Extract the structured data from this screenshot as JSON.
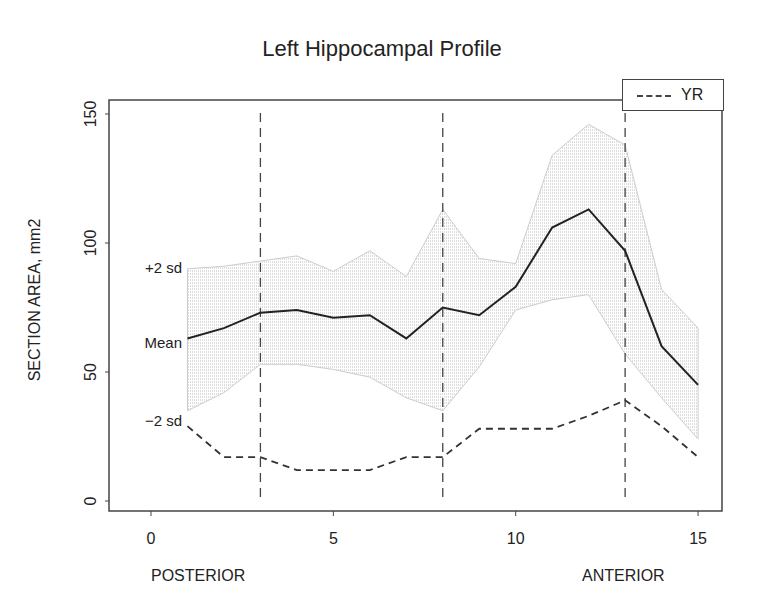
{
  "chart_data": {
    "type": "line",
    "title": "Left Hippocampal Profile",
    "xlabel_left": "POSTERIOR",
    "xlabel_right": "ANTERIOR",
    "ylabel": "SECTION AREA, mm2",
    "xlim": [
      -0.8,
      15.7
    ],
    "ylim": [
      -4,
      155
    ],
    "x_ticks": [
      0,
      5,
      10,
      15
    ],
    "y_ticks": [
      0,
      50,
      100,
      150
    ],
    "grid": false,
    "legend": {
      "position": "top-right",
      "entries": [
        "YR"
      ]
    },
    "vertical_lines": [
      3,
      8,
      13
    ],
    "band_labels": [
      "+2 sd",
      "Mean",
      "-2 sd"
    ],
    "x": [
      1,
      2,
      3,
      4,
      5,
      6,
      7,
      8,
      9,
      10,
      11,
      12,
      13,
      14,
      15
    ],
    "series": [
      {
        "name": "Mean",
        "style": "solid",
        "values": [
          63,
          67,
          73,
          74,
          71,
          72,
          63,
          75,
          72,
          83,
          106,
          113,
          97,
          60,
          45
        ]
      },
      {
        "name": "+2 sd",
        "style": "band-upper",
        "values": [
          90,
          91,
          93,
          95,
          89,
          97,
          87,
          113,
          94,
          92,
          134,
          146,
          138,
          82,
          67
        ]
      },
      {
        "name": "-2 sd",
        "style": "band-lower",
        "values": [
          35,
          42,
          53,
          53,
          51,
          48,
          40,
          35,
          52,
          74,
          78,
          80,
          57,
          40,
          24
        ]
      },
      {
        "name": "YR",
        "style": "dashed",
        "values": [
          29,
          17,
          17,
          12,
          12,
          12,
          17,
          17,
          28,
          28,
          28,
          33,
          39,
          29,
          17
        ]
      }
    ]
  }
}
